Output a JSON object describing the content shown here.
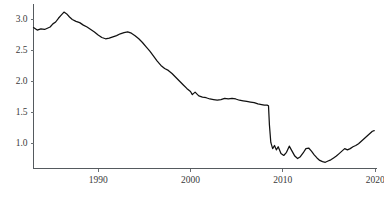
{
  "chart_data": {
    "type": "line",
    "title": "",
    "subtitle": "",
    "xlabel": "",
    "ylabel": "",
    "xlim": [
      1983.0,
      2020.2
    ],
    "ylim": [
      0.6,
      3.25
    ],
    "grid": false,
    "legend": "none",
    "legend_entries": [],
    "annotations": [],
    "yticks": [
      1.0,
      1.5,
      2.0,
      2.5,
      3.0
    ],
    "ytick_labels": [
      "1.0",
      "1.5",
      "2.0",
      "2.5",
      "3.0"
    ],
    "xticks": [
      1990,
      2000,
      2010,
      2020
    ],
    "xtick_labels": [
      "1990",
      "2000",
      "2010",
      "2020"
    ],
    "line_color": "#111111",
    "series": [
      {
        "name": "ratio",
        "x": [
          1983.0,
          1983.4,
          1983.8,
          1984.2,
          1984.5,
          1984.8,
          1985.1,
          1985.4,
          1985.7,
          1986.0,
          1986.3,
          1986.6,
          1986.9,
          1987.2,
          1987.6,
          1988.0,
          1988.4,
          1988.8,
          1989.2,
          1989.6,
          1990.0,
          1990.4,
          1990.8,
          1991.2,
          1991.6,
          1992.0,
          1992.4,
          1992.8,
          1993.2,
          1993.6,
          1994.0,
          1994.4,
          1994.8,
          1995.2,
          1995.6,
          1996.0,
          1996.4,
          1996.8,
          1997.2,
          1997.6,
          1998.0,
          1998.4,
          1998.8,
          1999.2,
          1999.6,
          2000.0,
          2000.2,
          2000.5,
          2000.9,
          2001.3,
          2001.7,
          2002.1,
          2002.5,
          2002.9,
          2003.3,
          2003.7,
          2004.1,
          2004.5,
          2004.9,
          2005.3,
          2005.7,
          2006.1,
          2006.5,
          2006.9,
          2007.3,
          2007.7,
          2008.0,
          2008.3,
          2008.45,
          2008.55,
          2008.7,
          2008.9,
          2009.1,
          2009.3,
          2009.5,
          2009.8,
          2010.1,
          2010.4,
          2010.7,
          2011.0,
          2011.3,
          2011.6,
          2011.9,
          2012.2,
          2012.5,
          2012.8,
          2013.1,
          2013.4,
          2013.7,
          2014.0,
          2014.3,
          2014.6,
          2014.9,
          2015.2,
          2015.5,
          2015.8,
          2016.1,
          2016.4,
          2016.7,
          2017.0,
          2017.3,
          2017.6,
          2017.9,
          2018.2,
          2018.5,
          2018.8,
          2019.1,
          2019.4,
          2019.7,
          2019.9
        ],
        "values": [
          2.87,
          2.83,
          2.85,
          2.84,
          2.86,
          2.88,
          2.93,
          2.96,
          3.02,
          3.07,
          3.12,
          3.09,
          3.04,
          3.0,
          2.97,
          2.95,
          2.91,
          2.88,
          2.84,
          2.8,
          2.75,
          2.71,
          2.69,
          2.7,
          2.72,
          2.74,
          2.77,
          2.79,
          2.8,
          2.78,
          2.74,
          2.69,
          2.63,
          2.56,
          2.49,
          2.41,
          2.33,
          2.26,
          2.21,
          2.18,
          2.13,
          2.07,
          2.01,
          1.95,
          1.89,
          1.84,
          1.79,
          1.83,
          1.77,
          1.75,
          1.74,
          1.72,
          1.71,
          1.7,
          1.71,
          1.73,
          1.72,
          1.73,
          1.72,
          1.7,
          1.69,
          1.68,
          1.67,
          1.66,
          1.64,
          1.63,
          1.62,
          1.62,
          1.61,
          1.3,
          1.02,
          0.92,
          0.97,
          0.9,
          0.95,
          0.84,
          0.81,
          0.86,
          0.96,
          0.88,
          0.8,
          0.76,
          0.79,
          0.85,
          0.92,
          0.93,
          0.88,
          0.82,
          0.77,
          0.73,
          0.71,
          0.7,
          0.72,
          0.74,
          0.77,
          0.8,
          0.84,
          0.88,
          0.92,
          0.9,
          0.92,
          0.95,
          0.97,
          1.0,
          1.04,
          1.08,
          1.12,
          1.16,
          1.2,
          1.21
        ]
      }
    ]
  },
  "axes": {
    "y_axis_name": "y-axis",
    "x_axis_name": "x-axis"
  }
}
